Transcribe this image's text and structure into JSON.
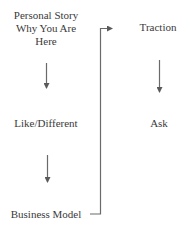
{
  "diagram": {
    "type": "flowchart",
    "line_color": "#5a5a5a",
    "text_color": "#3a3a3a",
    "left_column": {
      "nodes": [
        {
          "id": "personal-story",
          "lines": [
            "Personal Story",
            "Why You Are",
            "Here"
          ]
        },
        {
          "id": "like-different",
          "lines": [
            "Like/Different"
          ]
        },
        {
          "id": "business-model",
          "lines": [
            "Business Model"
          ]
        }
      ]
    },
    "right_column": {
      "nodes": [
        {
          "id": "traction",
          "lines": [
            "Traction"
          ]
        },
        {
          "id": "ask",
          "lines": [
            "Ask"
          ]
        }
      ]
    },
    "edges": [
      {
        "from": "personal-story",
        "to": "like-different",
        "style": "down-arrow"
      },
      {
        "from": "like-different",
        "to": "business-model",
        "style": "down-arrow"
      },
      {
        "from": "business-model",
        "to": "traction",
        "style": "elbow-connector"
      },
      {
        "from": "traction",
        "to": "ask",
        "style": "down-arrow"
      }
    ]
  }
}
